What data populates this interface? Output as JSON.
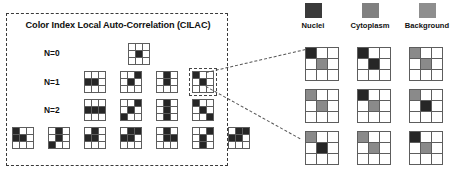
{
  "figure": {
    "panel_title": "Color Index Local Auto-Correlation (CILAC)"
  },
  "legend": {
    "items": [
      {
        "label": "Nuclei",
        "color": "#3a3a3a",
        "swatch_name": "nuclei-swatch"
      },
      {
        "label": "Cytoplasm",
        "color": "#808080",
        "swatch_name": "cytoplasm-swatch"
      },
      {
        "label": "Background",
        "color": "#8e8e8e",
        "swatch_name": "background-swatch"
      }
    ]
  },
  "mask_rows": [
    {
      "label": "N=0",
      "patterns": [
        {
          "cells": [
            0,
            0,
            0,
            0,
            1,
            0,
            0,
            0,
            0
          ],
          "selected": false
        }
      ]
    },
    {
      "label": "N=1",
      "patterns": [
        {
          "cells": [
            0,
            0,
            0,
            1,
            1,
            0,
            0,
            0,
            0
          ],
          "selected": false
        },
        {
          "cells": [
            0,
            0,
            1,
            0,
            1,
            0,
            0,
            0,
            0
          ],
          "selected": false
        },
        {
          "cells": [
            0,
            1,
            0,
            0,
            1,
            0,
            0,
            0,
            0
          ],
          "selected": false
        },
        {
          "cells": [
            1,
            0,
            0,
            0,
            1,
            0,
            0,
            0,
            0
          ],
          "selected": true
        }
      ]
    },
    {
      "label": "N=2",
      "patterns": [
        {
          "cells": [
            0,
            0,
            0,
            1,
            1,
            1,
            0,
            0,
            0
          ],
          "selected": false
        },
        {
          "cells": [
            0,
            0,
            1,
            0,
            1,
            0,
            1,
            0,
            0
          ],
          "selected": false
        },
        {
          "cells": [
            0,
            1,
            0,
            0,
            1,
            0,
            0,
            1,
            0
          ],
          "selected": false
        },
        {
          "cells": [
            1,
            0,
            0,
            0,
            1,
            0,
            0,
            0,
            1
          ],
          "selected": false
        }
      ]
    },
    {
      "label": "",
      "patterns": [
        {
          "cells": [
            1,
            0,
            0,
            1,
            1,
            0,
            0,
            0,
            0
          ],
          "selected": false
        },
        {
          "cells": [
            0,
            1,
            0,
            0,
            1,
            0,
            1,
            0,
            0
          ],
          "selected": false
        },
        {
          "cells": [
            0,
            1,
            0,
            1,
            1,
            0,
            0,
            0,
            0
          ],
          "selected": false
        },
        {
          "cells": [
            0,
            1,
            1,
            1,
            1,
            0,
            0,
            0,
            0
          ],
          "selected": false
        },
        {
          "cells": [
            0,
            1,
            0,
            0,
            1,
            1,
            0,
            0,
            0
          ],
          "selected": false
        },
        {
          "cells": [
            0,
            0,
            1,
            0,
            1,
            0,
            0,
            1,
            0
          ],
          "selected": false
        },
        {
          "cells": [
            0,
            1,
            1,
            1,
            1,
            0,
            0,
            0,
            0
          ],
          "selected": false
        }
      ]
    }
  ],
  "expanded_variants": {
    "rows": [
      [
        {
          "cells": [
            "d",
            "w",
            "w",
            "w",
            "g",
            "w",
            "w",
            "w",
            "w"
          ]
        },
        {
          "cells": [
            "d",
            "w",
            "w",
            "w",
            "d",
            "w",
            "w",
            "w",
            "w"
          ]
        },
        {
          "cells": [
            "g",
            "w",
            "w",
            "w",
            "g",
            "w",
            "w",
            "w",
            "w"
          ]
        }
      ],
      [
        {
          "cells": [
            "g",
            "w",
            "w",
            "w",
            "g",
            "w",
            "w",
            "w",
            "w"
          ]
        },
        {
          "cells": [
            "d",
            "w",
            "w",
            "w",
            "g",
            "w",
            "w",
            "w",
            "w"
          ]
        },
        {
          "cells": [
            "g",
            "w",
            "w",
            "w",
            "d",
            "w",
            "w",
            "w",
            "w"
          ]
        }
      ],
      [
        {
          "cells": [
            "g",
            "w",
            "w",
            "w",
            "d",
            "w",
            "w",
            "w",
            "w"
          ]
        },
        {
          "cells": [
            "g",
            "w",
            "w",
            "w",
            "g",
            "w",
            "w",
            "w",
            "w"
          ]
        },
        {
          "cells": [
            "d",
            "w",
            "w",
            "w",
            "g",
            "w",
            "w",
            "w",
            "w"
          ]
        }
      ]
    ]
  },
  "colors": {
    "dark": "#262626",
    "gray": "#8a8a8a",
    "white": "#ffffff",
    "grid_line": "#5d5d5d",
    "panel_border": "#3a3a3a"
  }
}
